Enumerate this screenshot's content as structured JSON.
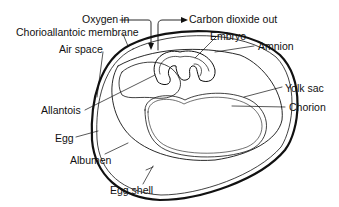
{
  "diagram": {
    "labels": {
      "oxygen_in": "Oxygen in",
      "co2_out": "Carbon dioxide out",
      "chorioallantoic": "Chorioallantoic membrane",
      "air_space": "Air space",
      "embryo": "Embryo",
      "amnion": "Amnion",
      "yolk_sac": "Yolk sac",
      "chorion": "Chorion",
      "allantois": "Allantois",
      "egg": "Egg",
      "albumen": "Albumen",
      "egg_shell": "Egg shell"
    },
    "colors": {
      "line": "#111111",
      "background": "#ffffff"
    }
  }
}
